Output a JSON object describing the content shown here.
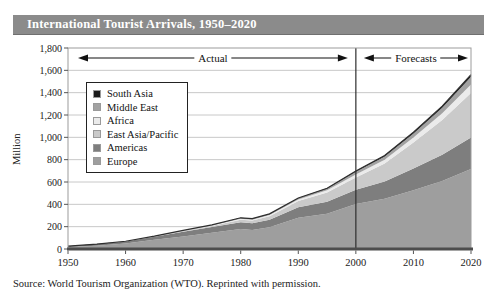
{
  "title_bar": {
    "text": "International Tourist Arrivals, 1950–2020",
    "bg_color": "#8b8b8b",
    "text_color": "#ffffff"
  },
  "source_note": "Source: World Tourism Organization (WTO). Reprinted with permission.",
  "chart_data": {
    "type": "area",
    "stacked": true,
    "title": "International Tourist Arrivals, 1950–2020",
    "xlabel": "",
    "ylabel": "Million",
    "xlim": [
      1950,
      2020
    ],
    "ylim": [
      0,
      1800
    ],
    "grid": true,
    "legend_position": "top-left-inside",
    "divider_year": 2000,
    "x": [
      1950,
      1955,
      1960,
      1965,
      1970,
      1975,
      1980,
      1982,
      1985,
      1990,
      1995,
      2000,
      2005,
      2010,
      2015,
      2020
    ],
    "series": [
      {
        "name": "Europe",
        "color": "#9e9e9e",
        "values": [
          17,
          30,
          50,
          82,
          113,
          146,
          178,
          170,
          195,
          280,
          315,
          403,
          450,
          527,
          610,
          717
        ]
      },
      {
        "name": "Americas",
        "color": "#7e7e7e",
        "values": [
          7.5,
          12,
          17,
          27,
          42,
          50,
          62,
          60,
          66,
          93,
          109,
          128,
          155,
          195,
          235,
          282
        ]
      },
      {
        "name": "East Asia/Pacific",
        "color": "#cacaca",
        "values": [
          0.2,
          0.5,
          0.9,
          2.5,
          6.2,
          10,
          23,
          25,
          33,
          56,
          82,
          110,
          160,
          231,
          310,
          397
        ]
      },
      {
        "name": "Africa",
        "color": "#ebebeb",
        "values": [
          0.5,
          0.7,
          0.8,
          1.5,
          2.4,
          4.7,
          7.2,
          8,
          10,
          15,
          20,
          27,
          35,
          46,
          60,
          77
        ]
      },
      {
        "name": "Middle East",
        "color": "#a2a2a2",
        "values": [
          0.2,
          0.4,
          0.6,
          1.2,
          1.9,
          3.5,
          7.1,
          7.5,
          8,
          9.6,
          14,
          24,
          29,
          36,
          50,
          69
        ]
      },
      {
        "name": "South Asia",
        "color": "#1b1b1b",
        "values": [
          0.03,
          0.1,
          0.2,
          0.5,
          0.9,
          1.5,
          2.2,
          2.3,
          2.5,
          3.2,
          4.2,
          6.1,
          8,
          11,
          14,
          19
        ]
      }
    ],
    "legend_order_note": "legend lists series top-of-stack first",
    "y_ticks": [
      {
        "value": 0,
        "label": "0"
      },
      {
        "value": 200,
        "label": "200"
      },
      {
        "value": 400,
        "label": "400"
      },
      {
        "value": 600,
        "label": "600"
      },
      {
        "value": 800,
        "label": "800"
      },
      {
        "value": 1000,
        "label": "1,000"
      },
      {
        "value": 1200,
        "label": "1,200"
      },
      {
        "value": 1400,
        "label": "1,400"
      },
      {
        "value": 1600,
        "label": "1,600"
      },
      {
        "value": 1800,
        "label": "1,800"
      }
    ],
    "x_ticks": [
      {
        "value": 1950,
        "label": "1950"
      },
      {
        "value": 1960,
        "label": "1960"
      },
      {
        "value": 1970,
        "label": "1970"
      },
      {
        "value": 1980,
        "label": "1980"
      },
      {
        "value": 1990,
        "label": "1990"
      },
      {
        "value": 2000,
        "label": "2000"
      },
      {
        "value": 2010,
        "label": "2010"
      },
      {
        "value": 2020,
        "label": "2020"
      }
    ],
    "annotations": [
      {
        "label": "Actual",
        "from": 1950,
        "to": 2000
      },
      {
        "label": "Forecasts",
        "from": 2000,
        "to": 2020
      }
    ],
    "colors": {
      "gridline": "#c8c8c8",
      "plot_border": "#9c9c9c",
      "bottom_axis": "#4d4d4d",
      "divider_line": "#2e2e2e",
      "stack_outline": "#2e2e2e"
    }
  }
}
